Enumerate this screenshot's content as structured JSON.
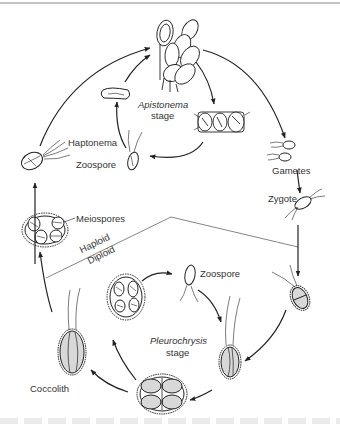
{
  "figure": {
    "type": "life-cycle diagram",
    "colors": {
      "line": "#222222",
      "divider": "#777777",
      "fill": "#d8d8d8",
      "text": "#333333",
      "top_rule": "#888888"
    }
  },
  "labels": {
    "apistonema_stage_name": "Apistonema",
    "apistonema_stage_word": "stage",
    "haptonema": "Haptonema",
    "zoospore_haploid": "Zoospore",
    "gametes": "Gametes",
    "zygote": "Zygote",
    "meiospores": "Meiospores",
    "haploid": "Haploid",
    "diploid": "Diploid",
    "zoospore_diploid": "Zoospore",
    "pleurochrysis_stage_name": "Pleurochrysis",
    "pleurochrysis_stage_word": "stage",
    "coccolith": "Coccolith"
  },
  "caption": {
    "visible": true,
    "text": ""
  }
}
